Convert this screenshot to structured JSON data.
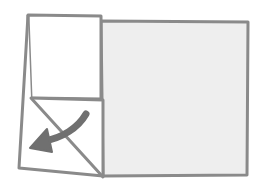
{
  "diagram": {
    "type": "origami-fold-step",
    "colors": {
      "background": "#ffffff",
      "paper_back": "#eeeeee",
      "paper_front": "#ffffff",
      "line": "#8a8a8a",
      "arrow": "#707070"
    },
    "elements": {
      "paper_right": "grey back side of paper",
      "flap_top": "white folded upper flap",
      "flap_bottom": "white lower triangle region",
      "diagonal_fold": "diagonal fold line",
      "arrow": "curved arrow pointing down-left"
    }
  }
}
